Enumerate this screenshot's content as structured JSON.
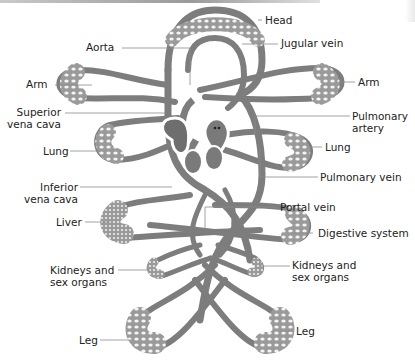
{
  "diagram": {
    "type": "anatomical-circulation-diagram",
    "colors": {
      "vessel": "#8a8a8a",
      "vessel_dark": "#5f5f5f",
      "capillary_bed": "#b4b4b4",
      "leader_line": "#8c8c8c",
      "text": "#222222"
    },
    "labels": {
      "head": "Head",
      "aorta": "Aorta",
      "jugular_vein": "Jugular vein",
      "arm_left": "Arm",
      "arm_right": "Arm",
      "superior_vena_cava_1": "Superior",
      "superior_vena_cava_2": "vena cava",
      "pulmonary_artery_1": "Pulmonary",
      "pulmonary_artery_2": "artery",
      "lung_left": "Lung",
      "lung_right": "Lung",
      "pulmonary_vein": "Pulmonary vein",
      "inferior_vena_cava_1": "Inferior",
      "inferior_vena_cava_2": "vena cava",
      "liver": "Liver",
      "portal_vein": "Portal vein",
      "digestive_system": "Digestive system",
      "kidneys_left_1": "Kidneys and",
      "kidneys_left_2": "sex organs",
      "kidneys_right_1": "Kidneys and",
      "kidneys_right_2": "sex organs",
      "leg_left": "Leg",
      "leg_right": "Leg"
    }
  }
}
